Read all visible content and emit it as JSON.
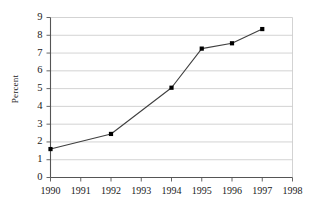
{
  "chart_data": {
    "type": "line",
    "title": "",
    "xlabel": "",
    "ylabel": "Percent",
    "x": [
      1990,
      1992,
      1994,
      1995,
      1996,
      1997
    ],
    "values": [
      1.6,
      2.45,
      5.05,
      7.25,
      7.55,
      8.35
    ],
    "series": [
      {
        "name": "Percent",
        "x": [
          1990,
          1992,
          1994,
          1995,
          1996,
          1997
        ],
        "values": [
          1.6,
          2.45,
          5.05,
          7.25,
          7.55,
          8.35
        ]
      }
    ],
    "xlim": [
      1990,
      1998
    ],
    "ylim": [
      0,
      9
    ],
    "x_tick_labels": [
      "1990",
      "1991",
      "1992",
      "1993",
      "1994",
      "1995",
      "1996",
      "1997",
      "1998"
    ],
    "x_ticks": [
      1990,
      1991,
      1992,
      1993,
      1994,
      1995,
      1996,
      1997,
      1998
    ],
    "y_tick_labels": [
      "0",
      "1",
      "2",
      "3",
      "4",
      "5",
      "6",
      "7",
      "8",
      "9"
    ],
    "y_ticks": [
      0,
      1,
      2,
      3,
      4,
      5,
      6,
      7,
      8,
      9
    ],
    "grid": "horizontal",
    "legend": "none",
    "marker": "square",
    "line_color": "#3f3f3f",
    "marker_color": "#000000",
    "grid_color": "#c8c8c8",
    "axis_color": "#555555"
  }
}
